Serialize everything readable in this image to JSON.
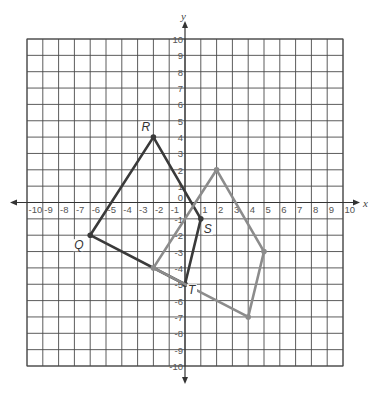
{
  "diagram": {
    "type": "coordinate-plane",
    "x_axis": {
      "label": "x",
      "min": -10,
      "max": 10,
      "step": 1
    },
    "y_axis": {
      "label": "y",
      "min": -10,
      "max": 10,
      "step": 1
    },
    "origin_label": "0",
    "colors": {
      "grid": "#4a4a4a",
      "axis": "#333333",
      "shape_dark": "#3a3a3a",
      "shape_light": "#8c8c8c",
      "background": "#ffffff"
    },
    "shapes": [
      {
        "name": "QRST",
        "style": "dark",
        "vertices": [
          {
            "label": "Q",
            "x": -6,
            "y": -2,
            "label_dx": -16,
            "label_dy": 14
          },
          {
            "label": "R",
            "x": -2,
            "y": 4,
            "label_dx": -12,
            "label_dy": -6
          },
          {
            "label": "S",
            "x": 1,
            "y": -1,
            "label_dx": 3,
            "label_dy": 14
          },
          {
            "label": "T",
            "x": 0,
            "y": -5,
            "label_dx": 3,
            "label_dy": 10
          }
        ]
      },
      {
        "name": "image",
        "style": "light",
        "vertices": [
          {
            "label": "",
            "x": -2,
            "y": -4
          },
          {
            "label": "",
            "x": 2,
            "y": 2
          },
          {
            "label": "",
            "x": 5,
            "y": -3
          },
          {
            "label": "",
            "x": 4,
            "y": -7
          }
        ]
      }
    ]
  }
}
